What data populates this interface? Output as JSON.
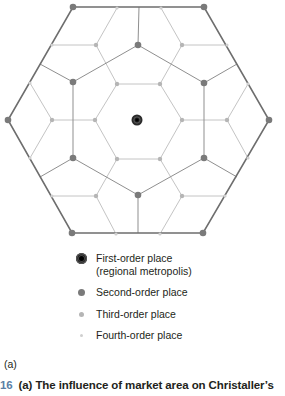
{
  "diagram": {
    "colors": {
      "outer_edge": "#6e6e6e",
      "second_edge": "#8f8f8f",
      "third_edge": "#c4c4c4",
      "first_place": "#111111",
      "second_place": "#7a7a7a",
      "third_place": "#b5b5b5",
      "fourth_place": "#cfcfcf"
    },
    "center": {
      "x": 137,
      "y": 120
    },
    "outer_hexagon": [
      [
        73,
        7
      ],
      [
        204,
        7
      ],
      [
        269,
        120
      ],
      [
        203,
        233
      ],
      [
        72,
        233
      ],
      [
        8,
        120
      ]
    ],
    "second_hexagon": [
      [
        138,
        45
      ],
      [
        204,
        83
      ],
      [
        204,
        158
      ],
      [
        138,
        195
      ],
      [
        73,
        158
      ],
      [
        73,
        82
      ]
    ],
    "second_spokes": [
      [
        [
          138,
          45
        ],
        [
          139,
          7
        ]
      ],
      [
        [
          204,
          83
        ],
        [
          237,
          64
        ]
      ],
      [
        [
          204,
          158
        ],
        [
          237,
          177
        ]
      ],
      [
        [
          138,
          195
        ],
        [
          138,
          233
        ]
      ],
      [
        [
          73,
          158
        ],
        [
          40,
          177
        ]
      ],
      [
        [
          73,
          82
        ],
        [
          40,
          64
        ]
      ]
    ],
    "inner_hexagon": [
      [
        117,
        84
      ],
      [
        160,
        84
      ],
      [
        182,
        120
      ],
      [
        160,
        159
      ],
      [
        117,
        159
      ],
      [
        95,
        120
      ]
    ],
    "third_branches": [
      {
        "from": [
          117,
          84
        ],
        "mid": [
          96,
          45
        ],
        "to": [
          [
            117,
            8
          ],
          [
            52,
            45
          ]
        ]
      },
      {
        "from": [
          160,
          84
        ],
        "mid": [
          182,
          45
        ],
        "to": [
          [
            161,
            8
          ],
          [
            227,
            45
          ]
        ]
      },
      {
        "from": [
          182,
          120
        ],
        "mid": [
          227,
          120
        ],
        "to": [
          [
            248,
            84
          ],
          [
            248,
            158
          ]
        ]
      },
      {
        "from": [
          160,
          159
        ],
        "mid": [
          182,
          196
        ],
        "to": [
          [
            225,
            196
          ],
          [
            160,
            234
          ]
        ]
      },
      {
        "from": [
          117,
          159
        ],
        "mid": [
          96,
          196
        ],
        "to": [
          [
            116,
            234
          ],
          [
            52,
            196
          ]
        ]
      },
      {
        "from": [
          95,
          120
        ],
        "mid": [
          52,
          120
        ],
        "to": [
          [
            30,
            83
          ],
          [
            30,
            158
          ]
        ]
      }
    ],
    "first_order_places": [
      [
        137,
        120
      ]
    ],
    "second_order_places": [
      [
        73,
        7
      ],
      [
        204,
        7
      ],
      [
        269,
        120
      ],
      [
        203,
        233
      ],
      [
        72,
        233
      ],
      [
        8,
        120
      ],
      [
        138,
        45
      ],
      [
        204,
        83
      ],
      [
        204,
        158
      ],
      [
        138,
        195
      ],
      [
        73,
        158
      ],
      [
        73,
        82
      ]
    ],
    "third_order_places": [
      [
        117,
        84
      ],
      [
        160,
        84
      ],
      [
        182,
        120
      ],
      [
        160,
        159
      ],
      [
        117,
        159
      ],
      [
        95,
        120
      ],
      [
        96,
        45
      ],
      [
        182,
        45
      ],
      [
        227,
        120
      ],
      [
        182,
        196
      ],
      [
        96,
        196
      ],
      [
        52,
        120
      ]
    ],
    "fourth_order_places": [
      [
        117,
        8
      ],
      [
        52,
        45
      ],
      [
        161,
        8
      ],
      [
        227,
        45
      ],
      [
        248,
        84
      ],
      [
        248,
        158
      ],
      [
        225,
        196
      ],
      [
        160,
        234
      ],
      [
        116,
        234
      ],
      [
        52,
        196
      ],
      [
        30,
        83
      ],
      [
        30,
        158
      ]
    ]
  },
  "legend": {
    "items": [
      {
        "symbol": "first-order-place-icon",
        "label": "First-order place",
        "sublabel": "(regional metropolis)"
      },
      {
        "symbol": "second-order-place-icon",
        "label": "Second-order place"
      },
      {
        "symbol": "third-order-place-icon",
        "label": "Third-order place"
      },
      {
        "symbol": "fourth-order-place-icon",
        "label": "Fourth-order place"
      }
    ]
  },
  "panel_label": "(a)",
  "caption": {
    "number": "16",
    "text": "(a) The influence of market area on Christaller’s"
  }
}
